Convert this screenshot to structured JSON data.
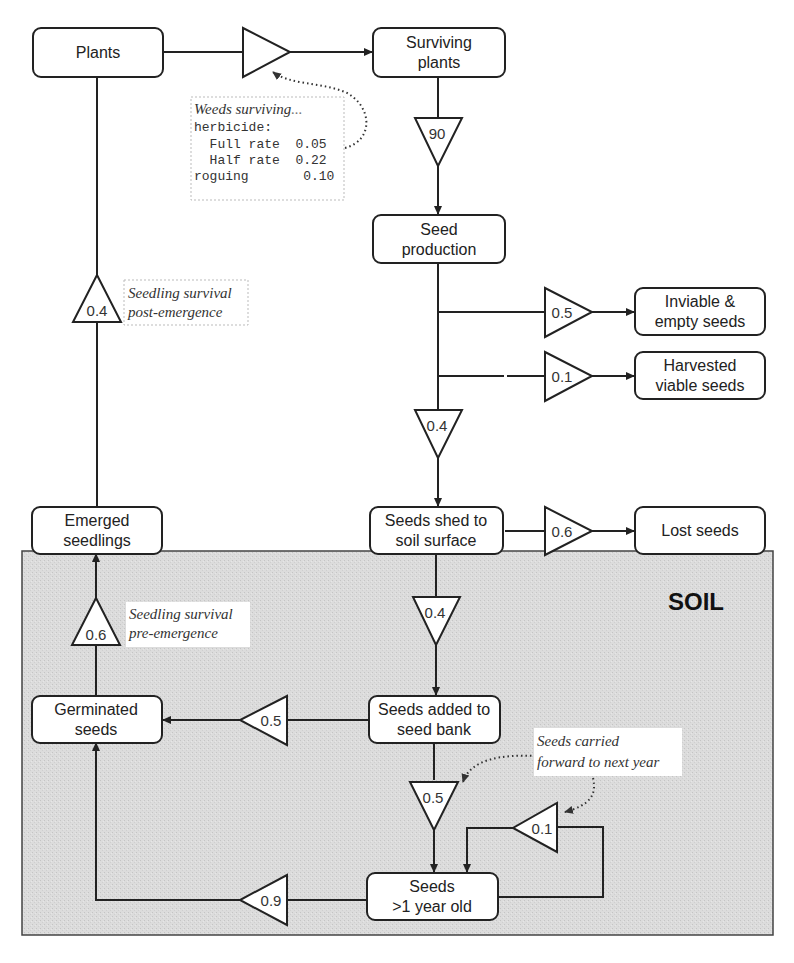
{
  "diagram": {
    "nodes": {
      "plants": "Plants",
      "surviving_plants": [
        "Surviving",
        "plants"
      ],
      "seed_production": [
        "Seed",
        "production"
      ],
      "inviable_seeds": [
        "Inviable &",
        "empty seeds"
      ],
      "harvested_seeds": [
        "Harvested",
        "viable seeds"
      ],
      "seeds_shed": [
        "Seeds shed to",
        "soil surface"
      ],
      "lost_seeds": "Lost seeds",
      "emerged_seedlings": [
        "Emerged",
        "seedlings"
      ],
      "germinated_seeds": [
        "Germinated",
        "seeds"
      ],
      "seeds_added": [
        "Seeds added to",
        "seed bank"
      ],
      "seeds_old": [
        "Seeds",
        ">1 year old"
      ]
    },
    "rates": {
      "weed_survival": "",
      "seed_production": "90",
      "inviable": "0.5",
      "harvested": "0.1",
      "shed": "0.4",
      "lost": "0.6",
      "added_to_bank": "0.4",
      "post_emergence": "0.4",
      "pre_emergence": "0.6",
      "germination_new": "0.5",
      "carried_new": "0.5",
      "carried_old": "0.1",
      "germination_old": "0.9"
    },
    "annotations": {
      "weeds_surviving": {
        "title": "Weeds surviving",
        "ellipsis": "...",
        "lines": [
          "herbicide:",
          "  Full rate  0.05",
          "  Half rate  0.22",
          "roguing       0.10"
        ]
      },
      "post_emergence": [
        "Seedling survival",
        "post-emergence"
      ],
      "pre_emergence": [
        "Seedling survival",
        "pre-emergence"
      ],
      "carried_forward": [
        "Seeds carried",
        "forward to next year"
      ]
    },
    "region_label": "SOIL",
    "colors": {
      "soil_fill": "#d9d9d9",
      "stroke": "#222222",
      "box_fill": "#ffffff"
    }
  }
}
